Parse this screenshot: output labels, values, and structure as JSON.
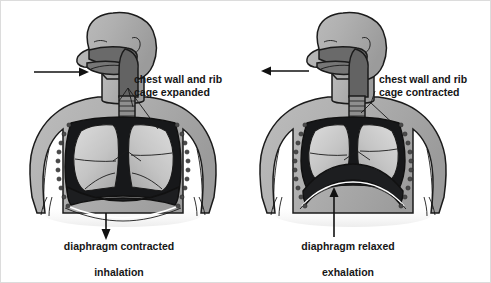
{
  "figure": {
    "background_color": "#ffffff",
    "border_color": "#dcdcdc",
    "text_color": "#161616",
    "palette": {
      "skin_gray": "#b0b0b0",
      "skin_gray_light": "#c6c6c6",
      "skin_gray_dark": "#9a9a9a",
      "airway_dark_gray": "#636363",
      "cavity_black": "#17181a",
      "lung_light": "#cfcfcf",
      "lung_mid": "#b8b8b8",
      "outline": "#1b1b1b",
      "rib_dot": "#4a4a4a"
    }
  },
  "panels": [
    {
      "id": "inhalation",
      "phase_label": "inhalation",
      "diaphragm_caption": "diaphragm contracted",
      "chest_label_line1": "chest wall and rib",
      "chest_label_line2": "cage expanded",
      "air_arrow_direction": "right",
      "air_arrow_meaning": "air in",
      "diaphragm_arrow_direction": "down",
      "diaphragm_arrow_meaning": "diaphragm moves down",
      "diaphragm_shape": "flattened, pulled downward",
      "thorax_state": "expanded"
    },
    {
      "id": "exhalation",
      "phase_label": "exhalation",
      "diaphragm_caption": "diaphragm relaxed",
      "chest_label_line1": "chest wall and rib",
      "chest_label_line2": "cage contracted",
      "air_arrow_direction": "left",
      "air_arrow_meaning": "air out",
      "diaphragm_arrow_direction": "up",
      "diaphragm_arrow_meaning": "diaphragm moves up",
      "diaphragm_shape": "domed, pushed upward",
      "thorax_state": "contracted"
    }
  ],
  "anatomy_parts": [
    "head profile",
    "nasal cavity",
    "oral cavity",
    "pharynx",
    "trachea",
    "bronchi",
    "left lung",
    "right lung",
    "rib cage",
    "chest wall",
    "diaphragm",
    "thoracic cavity"
  ]
}
